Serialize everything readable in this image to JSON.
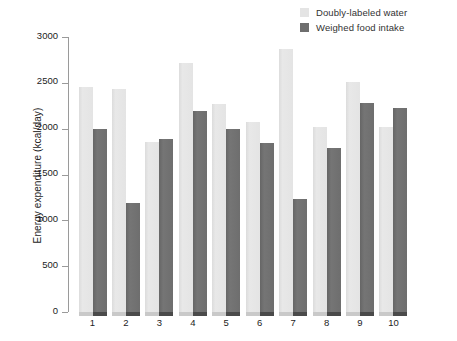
{
  "chart_data": {
    "type": "bar",
    "title": "",
    "xlabel": "",
    "ylabel": "Energy expenditure (kcal/day)",
    "ylim": [
      0,
      3000
    ],
    "ytick_labels": [
      "3000",
      "2500",
      "2000",
      "1500",
      "1000",
      "500",
      "0"
    ],
    "ytick_values": [
      3000,
      2500,
      2000,
      1500,
      1000,
      500,
      0
    ],
    "grid": false,
    "legend_position": "top-right",
    "categories": [
      "1",
      "2",
      "3",
      "4",
      "5",
      "6",
      "7",
      "8",
      "9",
      "10"
    ],
    "series": [
      {
        "name": "Doubly-labeled water",
        "color": "#e4e4e4",
        "values": [
          2460,
          2430,
          1850,
          2720,
          2270,
          2070,
          2870,
          2020,
          2510,
          2020
        ]
      },
      {
        "name": "Weighed food intake",
        "color": "#6e6e6e",
        "values": [
          2000,
          1190,
          1890,
          2190,
          2000,
          1840,
          1230,
          1790,
          2280,
          2230
        ]
      }
    ]
  },
  "legend": {
    "items": [
      {
        "label": "Doubly-labeled water",
        "color": "#e4e4e4"
      },
      {
        "label": "Weighed food intake",
        "color": "#6e6e6e"
      }
    ]
  }
}
